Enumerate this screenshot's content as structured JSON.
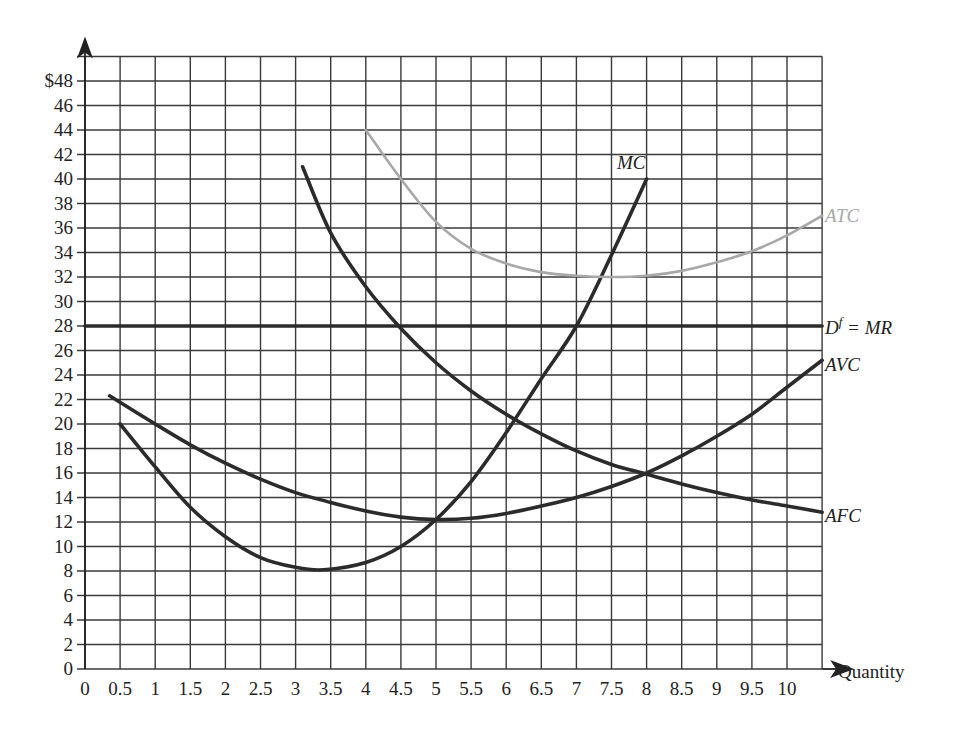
{
  "chart_data": {
    "type": "line",
    "title": "",
    "xlabel": "Quantity",
    "ylabel": "$",
    "xlim": [
      0,
      10.5
    ],
    "ylim": [
      0,
      50
    ],
    "grid": true,
    "x_ticks": [
      "0",
      "0.5",
      "1",
      "1.5",
      "2",
      "2.5",
      "3",
      "3.5",
      "4",
      "4.5",
      "5",
      "5.5",
      "6",
      "6.5",
      "7",
      "7.5",
      "8",
      "8.5",
      "9",
      "9.5",
      "10"
    ],
    "y_ticks": [
      "0",
      "2",
      "4",
      "6",
      "8",
      "10",
      "12",
      "14",
      "16",
      "18",
      "20",
      "22",
      "24",
      "26",
      "28",
      "30",
      "32",
      "34",
      "36",
      "38",
      "40",
      "42",
      "44",
      "46",
      "$48"
    ],
    "series": [
      {
        "name": "MC",
        "color": "#2b2b2b",
        "label_pos": [
          7.6,
          41
        ],
        "x": [
          0.5,
          1,
          1.5,
          2,
          2.5,
          3,
          3.4,
          4,
          4.5,
          5,
          5.5,
          6,
          6.5,
          7,
          7.5,
          8
        ],
        "y": [
          20,
          16.5,
          13.2,
          10.8,
          9.1,
          8.3,
          8.1,
          8.7,
          10,
          12.2,
          15.3,
          19.3,
          23.7,
          28,
          33.8,
          40
        ]
      },
      {
        "name": "ATC",
        "color": "#a8a8a8",
        "label_pos": [
          10.55,
          37
        ],
        "x": [
          4,
          4.5,
          5,
          5.5,
          6,
          6.5,
          7,
          7.5,
          8,
          8.5,
          9,
          9.5,
          10,
          10.5
        ],
        "y": [
          44,
          40,
          36.5,
          34.3,
          33.1,
          32.4,
          32.1,
          32,
          32.1,
          32.5,
          33.2,
          34.1,
          35.4,
          37
        ]
      },
      {
        "name": "Df = MR",
        "color": "#2b2b2b",
        "label_pos": [
          10.55,
          28
        ],
        "x": [
          0,
          10.5
        ],
        "y": [
          28,
          28
        ]
      },
      {
        "name": "AVC",
        "color": "#2b2b2b",
        "label_pos": [
          10.55,
          25
        ],
        "x": [
          0.35,
          1,
          1.5,
          2,
          2.5,
          3,
          3.5,
          4,
          4.5,
          5,
          5.5,
          6,
          6.5,
          7,
          7.5,
          8,
          8.5,
          9,
          9.5,
          10,
          10.5
        ],
        "y": [
          22.3,
          20,
          18.3,
          16.8,
          15.5,
          14.4,
          13.6,
          12.9,
          12.4,
          12.2,
          12.3,
          12.7,
          13.3,
          14,
          14.9,
          16,
          17.4,
          19,
          20.8,
          23,
          25.2
        ]
      },
      {
        "name": "AFC",
        "color": "#2b2b2b",
        "label_pos": [
          10.55,
          12.5
        ],
        "x": [
          3.1,
          3.5,
          4,
          4.5,
          5,
          5.5,
          6,
          6.5,
          7,
          7.5,
          8,
          8.5,
          9,
          9.5,
          10,
          10.5
        ],
        "y": [
          41,
          35.6,
          31.2,
          27.8,
          25,
          22.7,
          20.8,
          19.2,
          17.8,
          16.7,
          15.9,
          15.1,
          14.4,
          13.8,
          13.3,
          12.8
        ]
      }
    ],
    "labels": {
      "MC": "MC",
      "ATC": "ATC",
      "Df_MR": "D",
      "Df_sup": "f",
      "Df_rest": " = MR",
      "AVC": "AVC",
      "AFC": "AFC",
      "xaxis": "Quantity"
    }
  }
}
